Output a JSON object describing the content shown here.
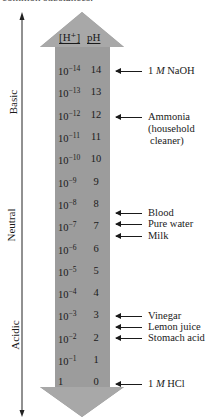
{
  "caption": "common substances.",
  "headers": {
    "h_conc": "[H⁺]",
    "ph": "pH"
  },
  "axis": {
    "top_label": "Basic",
    "middle_label": "Neutral",
    "bottom_label": "Acidic"
  },
  "colors": {
    "arrow_fill": "#9c9c9c",
    "arrow_head": "#a8a8a8",
    "text": "#1a1a1a"
  },
  "rows": [
    {
      "base": "10",
      "exp": "−14",
      "ph": "14",
      "y": 64
    },
    {
      "base": "10",
      "exp": "−13",
      "ph": "13",
      "y": 86
    },
    {
      "base": "10",
      "exp": "−12",
      "ph": "12",
      "y": 109
    },
    {
      "base": "10",
      "exp": "−11",
      "ph": "11",
      "y": 131
    },
    {
      "base": "10",
      "exp": "−10",
      "ph": "10",
      "y": 153
    },
    {
      "base": "10",
      "exp": "−9",
      "ph": "9",
      "y": 176
    },
    {
      "base": "10",
      "exp": "−8",
      "ph": "8",
      "y": 198
    },
    {
      "base": "10",
      "exp": "−7",
      "ph": "7",
      "y": 220
    },
    {
      "base": "10",
      "exp": "−6",
      "ph": "6",
      "y": 243
    },
    {
      "base": "10",
      "exp": "−5",
      "ph": "5",
      "y": 265
    },
    {
      "base": "10",
      "exp": "−4",
      "ph": "4",
      "y": 287
    },
    {
      "base": "10",
      "exp": "−3",
      "ph": "3",
      "y": 309
    },
    {
      "base": "10",
      "exp": "−2",
      "ph": "2",
      "y": 332
    },
    {
      "base": "10",
      "exp": "−1",
      "ph": "1",
      "y": 354
    },
    {
      "base": "1",
      "exp": "",
      "ph": "0",
      "y": 376
    }
  ],
  "substances": [
    {
      "pre": "1 ",
      "italic": "M",
      "post": " NaOH",
      "sub": "",
      "sub2": "",
      "y": 65
    },
    {
      "pre": "Ammonia",
      "italic": "",
      "post": "",
      "sub": "(household",
      "sub2": "cleaner)",
      "y": 111
    },
    {
      "pre": "Blood",
      "italic": "",
      "post": "",
      "sub": "",
      "sub2": "",
      "y": 207
    },
    {
      "pre": "Pure water",
      "italic": "",
      "post": "",
      "sub": "",
      "sub2": "",
      "y": 218
    },
    {
      "pre": "Milk",
      "italic": "",
      "post": "",
      "sub": "",
      "sub2": "",
      "y": 230
    },
    {
      "pre": "Vinegar",
      "italic": "",
      "post": "",
      "sub": "",
      "sub2": "",
      "y": 310
    },
    {
      "pre": "Lemon juice",
      "italic": "",
      "post": "",
      "sub": "",
      "sub2": "",
      "y": 321
    },
    {
      "pre": "Stomach acid",
      "italic": "",
      "post": "",
      "sub": "",
      "sub2": "",
      "y": 332
    },
    {
      "pre": "1 ",
      "italic": "M",
      "post": " HCl",
      "sub": "",
      "sub2": "",
      "y": 378
    }
  ]
}
